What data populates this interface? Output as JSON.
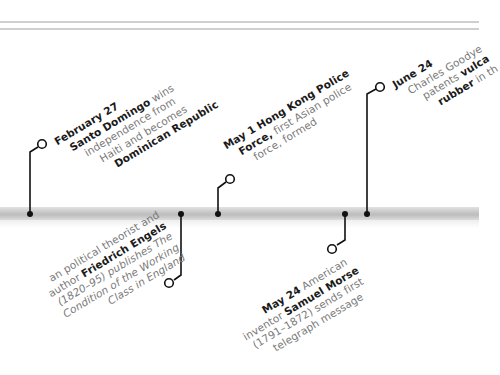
{
  "decor": {
    "rule_color": "#cfcfcf",
    "bar_color": "#c4c4c4",
    "connector_color": "#111111"
  },
  "events_above": [
    {
      "id": "feb27",
      "date": "February 27",
      "lines": [
        {
          "bold": "Santo Domingo",
          "text": " wins"
        },
        {
          "text": "independence from"
        },
        {
          "text": "Haiti and becomes"
        },
        {
          "bold": "Dominican Republic"
        }
      ]
    },
    {
      "id": "may1",
      "date": "May 1",
      "lines": [
        {
          "bold": "Hong Kong Police",
          "text": ""
        },
        {
          "bold": "Force,",
          "text": " first Asian police"
        },
        {
          "text": "force, formed"
        }
      ]
    },
    {
      "id": "jun24",
      "date": "June 24",
      "lines": [
        {
          "text": "Charles Goodye"
        },
        {
          "text": "patents ",
          "bold": "vulca"
        },
        {
          "bold": "rubber",
          "text": " in th"
        }
      ]
    }
  ],
  "events_below": [
    {
      "id": "engels",
      "lines": [
        {
          "text": "an political theorist and"
        },
        {
          "text": "author ",
          "bold": "Friedrich Engels"
        },
        {
          "text": "(1820–95) publishes The"
        },
        {
          "text": "Condition of the Working"
        },
        {
          "text": "Class in England"
        }
      ]
    },
    {
      "id": "may24",
      "date": "May 24",
      "lines": [
        {
          "text": " American"
        },
        {
          "text": "inventor ",
          "bold": "Samuel Morse"
        },
        {
          "text": "(1791–1872) sends first"
        },
        {
          "text": "telegraph message"
        }
      ]
    }
  ]
}
